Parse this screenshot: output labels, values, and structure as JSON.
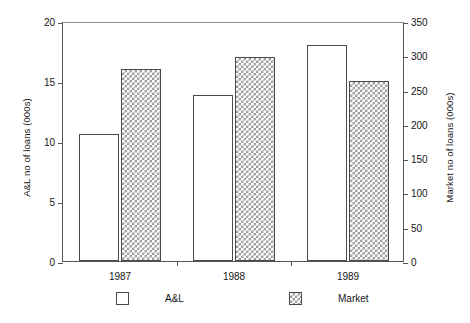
{
  "chart_data": {
    "type": "bar",
    "title": "",
    "xlabel": "",
    "categories": [
      "1987",
      "1988",
      "1989"
    ],
    "grid": false,
    "legend_position": "bottom",
    "series": [
      {
        "name": "A&L",
        "axis": "left",
        "fill": "white",
        "values": [
          10.6,
          13.8,
          18.0
        ]
      },
      {
        "name": "Market",
        "axis": "right",
        "fill": "crosshatch",
        "values": [
          280,
          298,
          262
        ]
      }
    ],
    "axes": {
      "left": {
        "label": "A&L no of loans (000s)",
        "ticks": [
          0,
          5,
          10,
          15,
          20
        ],
        "tick_labels": [
          "0",
          "5",
          "10",
          "15",
          "20"
        ],
        "lim": [
          0,
          20
        ]
      },
      "right": {
        "label": "Market no of loans (000s)",
        "ticks": [
          0,
          50,
          100,
          150,
          200,
          250,
          300,
          350
        ],
        "tick_labels": [
          "0",
          "50",
          "100",
          "150",
          "200",
          "250",
          "300",
          "350"
        ],
        "lim": [
          0,
          350
        ]
      }
    }
  },
  "legend": {
    "items": [
      {
        "label": "A&L",
        "swatch": "white-square-icon"
      },
      {
        "label": "Market",
        "swatch": "crosshatch-square-icon"
      }
    ]
  },
  "colors": {
    "axis": "#555555",
    "bar_outline": "#4a4a4a",
    "hatch": "#9b9b9b",
    "background": "#ffffff",
    "text": "#141414"
  }
}
